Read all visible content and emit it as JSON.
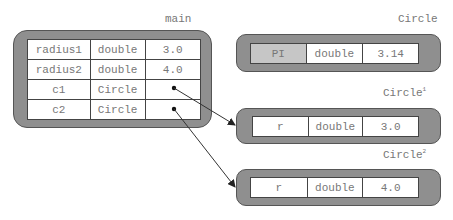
{
  "frames": {
    "main": {
      "title": "main",
      "rows": [
        {
          "name": "radius1",
          "type": "double",
          "value": "3.0"
        },
        {
          "name": "radius2",
          "type": "double",
          "value": "4.0"
        },
        {
          "name": "c1",
          "type": "Circle",
          "value": ""
        },
        {
          "name": "c2",
          "type": "Circle",
          "value": ""
        }
      ]
    },
    "circle_class": {
      "title": "Circle",
      "rows": [
        {
          "name": "PI",
          "type": "double",
          "value": "3.14"
        }
      ]
    },
    "circle1": {
      "title": "Circle",
      "sup": "1",
      "rows": [
        {
          "name": "r",
          "type": "double",
          "value": "3.0"
        }
      ]
    },
    "circle2": {
      "title": "Circle",
      "sup": "2",
      "rows": [
        {
          "name": "r",
          "type": "double",
          "value": "4.0"
        }
      ]
    }
  },
  "references": [
    {
      "from": "main.c1",
      "to": "circle1"
    },
    {
      "from": "main.c2",
      "to": "circle2"
    }
  ],
  "colors": {
    "frame": "#8f8f8f",
    "highlight_cell": "#c6c6c6",
    "border": "#444444",
    "text": "#777777"
  }
}
